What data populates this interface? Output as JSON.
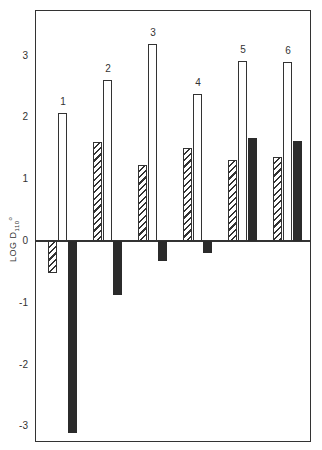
{
  "chart_data": {
    "type": "bar",
    "title": "",
    "xlabel": "",
    "ylabel": "LOG D110°",
    "ylabel_parts": {
      "main": "LOG  D",
      "sub": "110",
      "sup": "o"
    },
    "ylim": [
      -3.3,
      3.7
    ],
    "yticks": [
      -3,
      -2,
      -1,
      0,
      1,
      2,
      3
    ],
    "grid": false,
    "legend": null,
    "categories": [
      "1",
      "2",
      "3",
      "4",
      "5",
      "6"
    ],
    "series": [
      {
        "name": "hatched",
        "pattern": "hatched",
        "values": [
          -0.52,
          1.6,
          1.23,
          1.5,
          1.31,
          1.36
        ]
      },
      {
        "name": "open",
        "pattern": "white",
        "values": [
          2.07,
          2.6,
          3.18,
          2.38,
          2.92,
          2.9
        ]
      },
      {
        "name": "solid",
        "pattern": "black",
        "values": [
          -3.1,
          -0.88,
          -0.32,
          -0.2,
          1.67,
          1.62
        ]
      }
    ]
  },
  "colors": {
    "axis": "#333333",
    "solid": "#2b2b2b",
    "background": "#ffffff"
  }
}
